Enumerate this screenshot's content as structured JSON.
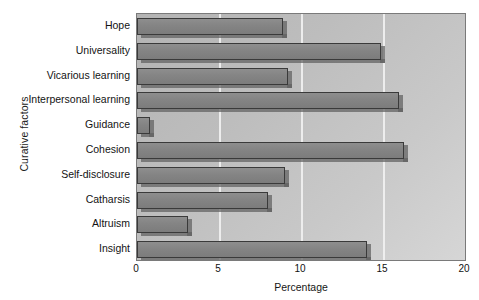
{
  "chart_data": {
    "type": "bar",
    "orientation": "horizontal",
    "title": "",
    "xlabel": "Percentage",
    "ylabel": "Curative factors",
    "categories": [
      "Hope",
      "Universality",
      "Vicarious learning",
      "Interpersonal learning",
      "Guidance",
      "Cohesion",
      "Self-disclosure",
      "Catharsis",
      "Altruism",
      "Insight"
    ],
    "values": [
      8.9,
      14.9,
      9.2,
      16.0,
      0.8,
      16.3,
      9.0,
      8.0,
      3.1,
      14.0
    ],
    "xlim": [
      0,
      20
    ],
    "xticks": [
      0,
      5,
      10,
      15,
      20
    ],
    "xtick_labels": [
      "0",
      "5",
      "10",
      "15",
      "20"
    ],
    "grid": true,
    "legend": false,
    "colors": {
      "bar_fill": "#848484",
      "bar_edge": "#3a3a3a",
      "bar_shadow": "#5f5f5f",
      "plot_background": "#bfbfbf",
      "gridline": "#efefef",
      "text": "#131313",
      "page_background": "#ffffff"
    }
  }
}
